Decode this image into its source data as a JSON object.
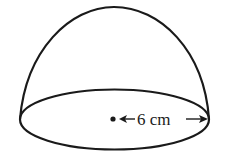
{
  "diagram": {
    "shape": "hemisphere",
    "radius_label": "6 cm",
    "stroke_color": "#1a1a1a",
    "background": "#ffffff"
  }
}
